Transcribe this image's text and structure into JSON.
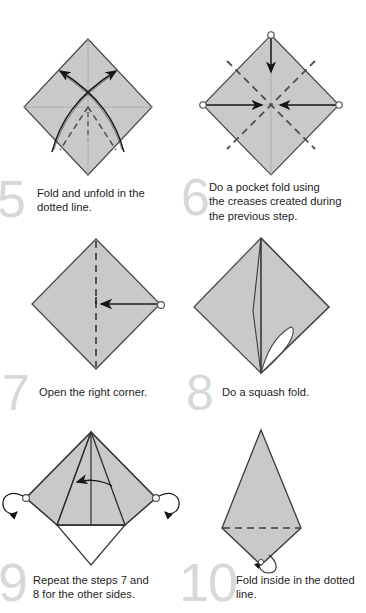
{
  "document": {
    "type": "origami-instruction-sheet",
    "title": "Origami folding steps 5 to 10",
    "paper_fill": "#c9c9c9",
    "paper_fill_shade": "#bdbdbd",
    "paper_outline": "#4a4a4a",
    "crease_color": "#555555",
    "arrow_color": "#1a1a1a",
    "step_number_color": "#d8d8d8",
    "background": "#ffffff"
  },
  "steps": [
    {
      "number": "5",
      "caption": "Fold and unfold in the dotted line.",
      "caption_lines": [
        "Fold and unfold in the",
        "dotted line."
      ],
      "figure": "diamond-with-crossed-curved-arrows",
      "markers": []
    },
    {
      "number": "6",
      "caption": "Do a pocket fold using the creases created during the previous step.",
      "caption_lines": [
        "Do a pocket fold using",
        "the creases created during",
        "the previous step."
      ],
      "figure": "diamond-with-dashed-diagonals-and-three-arrows",
      "markers": [
        "top-vertex-circle",
        "left-vertex-circle",
        "right-vertex-circle"
      ]
    },
    {
      "number": "7",
      "caption": "Open the right corner.",
      "caption_lines": [
        "Open the right corner."
      ],
      "figure": "diamond-with-vertical-dashed-crease-and-right-arrow",
      "markers": [
        "right-vertex-circle"
      ]
    },
    {
      "number": "8",
      "caption": "Do a squash fold.",
      "caption_lines": [
        "Do a squash fold."
      ],
      "figure": "diamond-with-open-white-pocket",
      "markers": []
    },
    {
      "number": "9",
      "caption": "Repeat the steps 7 and 8 for the other sides.",
      "caption_lines": [
        "Repeat the steps 7 and",
        "8 for the other sides."
      ],
      "figure": "squashed-diamond-with-turn-over-arrows",
      "markers": [
        "left-vertex-circle",
        "right-vertex-circle",
        "left-curl-arrow",
        "right-curl-arrow"
      ]
    },
    {
      "number": "10",
      "caption": "Fold inside in the dotted line.",
      "caption_lines": [
        "Fold inside in the dotted",
        "line."
      ],
      "figure": "kite-with-horizontal-dashed-line-and-loop-arrow",
      "markers": [
        "bottom-loop-arrow"
      ]
    }
  ]
}
